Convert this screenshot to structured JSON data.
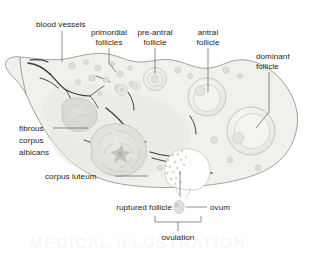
{
  "figure": {
    "background_color": "#ffffff",
    "body_fill": "#f0f1ec",
    "outline_color": "#9ea59c",
    "text_color": "#242424",
    "leader_color": "#4a4a4a"
  },
  "labels": {
    "blood_vessels": "blood vessels",
    "primordial_follicles_l1": "primordial",
    "primordial_follicles_l2": "follicles",
    "pre_antral_l1": "pre-antral",
    "pre_antral_l2": "follicle",
    "antral_l1": "antral",
    "antral_l2": "follicle",
    "dominant_l1": "dominant",
    "dominant_l2": "follicle",
    "fibrous_l1": "fibrous",
    "fibrous_l2": "corpus",
    "fibrous_l3": "albicans",
    "corpus_luteum": "corpus luteum",
    "ruptured_follicle": "ruptured follicle",
    "ovum": "ovum",
    "ovulation": "ovulation"
  },
  "structures": [
    {
      "name": "blood-vessels",
      "label": "blood vessels",
      "region": "hilum"
    },
    {
      "name": "primordial-follicles",
      "label": "primordial follicles",
      "region": "cortex-upper-left"
    },
    {
      "name": "pre-antral-follicle",
      "label": "pre-antral follicle",
      "region": "cortex-upper-middle"
    },
    {
      "name": "antral-follicle",
      "label": "antral follicle",
      "region": "cortex-upper-right"
    },
    {
      "name": "dominant-follicle",
      "label": "dominant follicle",
      "region": "cortex-right"
    },
    {
      "name": "fibrous-corpus-albicans",
      "label": "fibrous corpus albicans",
      "region": "medulla-left"
    },
    {
      "name": "corpus-luteum",
      "label": "corpus luteum",
      "region": "medulla-lower-left"
    },
    {
      "name": "ruptured-follicle",
      "label": "ruptured follicle",
      "region": "surface-bottom"
    },
    {
      "name": "ovum",
      "label": "ovum",
      "region": "outside-bottom"
    },
    {
      "name": "ovulation",
      "label": "ovulation",
      "region": "bracket-bottom"
    }
  ]
}
